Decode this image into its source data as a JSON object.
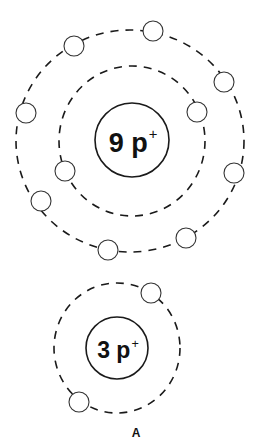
{
  "diagram": {
    "type": "bohr-atom-models",
    "caption": "A",
    "colors": {
      "line": "#1a1a1a",
      "background": "#ffffff"
    },
    "atoms": [
      {
        "name": "upper-atom",
        "protons": 9,
        "nucleus_label": {
          "number": "9 p",
          "charge": "+"
        },
        "nucleus": {
          "cx": 132,
          "cy": 140,
          "r": 37
        },
        "shells": [
          {
            "rx": 73,
            "ry": 75,
            "cx": 132,
            "cy": 141,
            "electrons": 2
          },
          {
            "rx": 114,
            "ry": 111,
            "cx": 130,
            "cy": 141,
            "electrons": 7
          }
        ],
        "electrons": [
          {
            "shell": 1,
            "cx": 197,
            "cy": 112
          },
          {
            "shell": 1,
            "cx": 65,
            "cy": 171
          },
          {
            "shell": 2,
            "cx": 74,
            "cy": 46
          },
          {
            "shell": 2,
            "cx": 153,
            "cy": 31
          },
          {
            "shell": 2,
            "cx": 224,
            "cy": 82
          },
          {
            "shell": 2,
            "cx": 26,
            "cy": 113
          },
          {
            "shell": 2,
            "cx": 234,
            "cy": 173
          },
          {
            "shell": 2,
            "cx": 41,
            "cy": 201
          },
          {
            "shell": 2,
            "cx": 186,
            "cy": 238
          },
          {
            "shell": 2,
            "cx": 108,
            "cy": 250
          }
        ]
      },
      {
        "name": "lower-atom",
        "protons": 3,
        "nucleus_label": {
          "number": "3 p",
          "charge": "+"
        },
        "nucleus": {
          "cx": 117,
          "cy": 348,
          "r": 31
        },
        "shells": [
          {
            "rx": 63,
            "ry": 65,
            "cx": 117,
            "cy": 348,
            "electrons": 2
          }
        ],
        "electrons": [
          {
            "shell": 1,
            "cx": 151,
            "cy": 293
          },
          {
            "shell": 1,
            "cx": 79,
            "cy": 402
          }
        ]
      }
    ]
  }
}
